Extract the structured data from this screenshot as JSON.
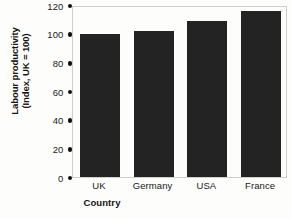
{
  "chart_data": {
    "type": "bar",
    "title": "",
    "categories": [
      "UK",
      "Germany",
      "USA",
      "France"
    ],
    "values": [
      100,
      102,
      109,
      116
    ],
    "series": [
      {
        "name": "Labour productivity",
        "values": [
          100,
          102,
          109,
          116
        ]
      }
    ],
    "xlabel": "Country",
    "ylabel": "Labour productivity (Index, UK = 100)",
    "ylabel_line1": "Labour productivity",
    "ylabel_line2": "(Index, UK = 100)",
    "ylim": [
      0,
      120
    ],
    "yticks": [
      0,
      20,
      40,
      60,
      80,
      100,
      120
    ],
    "ytick_labels": [
      "0",
      "20",
      "40",
      "60",
      "80",
      "100",
      "120"
    ],
    "ytick_marker": "filled-dot",
    "grid": false,
    "legend": null,
    "legend_position": "none",
    "bar_color": "#232323",
    "background_color": "#fdfdfb",
    "axis_border_color": "#cfcfcb",
    "text_color": "#1a1a1a"
  }
}
